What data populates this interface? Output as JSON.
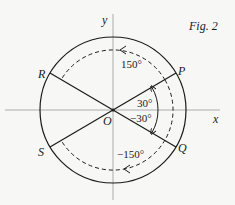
{
  "figure": {
    "caption": "Fig. 2",
    "axes": {
      "x_label": "x",
      "y_label": "y"
    },
    "origin_label": "O",
    "points": [
      {
        "id": "P",
        "label": "P",
        "angle_deg": 30
      },
      {
        "id": "Q",
        "label": "Q",
        "angle_deg": -30
      },
      {
        "id": "R",
        "label": "R",
        "angle_deg": 150
      },
      {
        "id": "S",
        "label": "S",
        "angle_deg": -150
      }
    ],
    "angles": {
      "a30": "30°",
      "am30": "−30°",
      "a150": "150°",
      "am150": "−150°"
    },
    "colors": {
      "ink": "#1a1a1a",
      "axis": "#9a9a9a",
      "background": "#f7f7f5"
    }
  }
}
